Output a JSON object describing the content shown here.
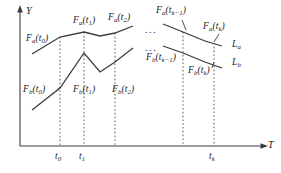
{
  "figure": {
    "kind": "line-diagram",
    "background_color": "#ffffff",
    "line_color": "#3c3c3c",
    "dashed_color": "#6b6b6b",
    "text_color": "#1c1c1c"
  },
  "axes": {
    "y_label": "Y",
    "x_label": "T",
    "origin": {
      "x": 20,
      "y": 146
    },
    "y_top": {
      "x": 20,
      "y": 8
    },
    "x_right": {
      "x": 268,
      "y": 146
    }
  },
  "ticks": [
    {
      "id": "t0",
      "base": "t",
      "sub": "0",
      "x": 60
    },
    {
      "id": "t1",
      "base": "t",
      "sub": "1",
      "x": 84
    },
    {
      "id": "tk",
      "base": "t",
      "sub": "k",
      "x": 214
    }
  ],
  "drop_lines_x": [
    60,
    84,
    115,
    183,
    214
  ],
  "curves": [
    {
      "name": "La",
      "label_base": "L",
      "label_sub": "a",
      "label_x": 232,
      "label_y": 45,
      "segments": [
        {
          "points": "32,54 60,37 84,32 100,36 115,33 133,26"
        },
        {
          "points": "163,24 183,32 205,41 222,46"
        }
      ]
    },
    {
      "name": "Lb",
      "label_base": "L",
      "label_sub": "b",
      "label_x": 232,
      "label_y": 63,
      "segments": [
        {
          "points": "32,110 60,88 84,53 100,72 115,62 133,48"
        },
        {
          "points": "163,46 183,53 205,62 222,68"
        }
      ]
    }
  ],
  "ellipses": [
    {
      "id": "upper-ellipsis",
      "text": "...",
      "x": 145,
      "y": 27
    },
    {
      "id": "lower-ellipsis",
      "text": "...",
      "x": 145,
      "y": 45
    }
  ],
  "point_labels": [
    {
      "id": "Fa_t0",
      "base": "F",
      "base_sub": "a",
      "arg_base": "t",
      "arg_sub": "0",
      "x": 28,
      "y": 39,
      "leader": null
    },
    {
      "id": "Fa_t1",
      "base": "F",
      "base_sub": "a",
      "arg_base": "t",
      "arg_sub": "1",
      "x": 74,
      "y": 20,
      "leader": null
    },
    {
      "id": "Fa_t2",
      "base": "F",
      "base_sub": "a",
      "arg_base": "t",
      "arg_sub": "2",
      "x": 110,
      "y": 17,
      "leader": null
    },
    {
      "id": "Fa_tk1",
      "base": "F",
      "base_sub": "a",
      "arg_base": "t",
      "arg_sub": "k−1",
      "x": 155,
      "y": 10,
      "leader": "163,19 170,32"
    },
    {
      "id": "Fa_tk",
      "base": "F",
      "base_sub": "a",
      "arg_base": "t",
      "arg_sub": "k",
      "x": 205,
      "y": 26,
      "leader": "212,35 206,42"
    },
    {
      "id": "Fb_t0",
      "base": "F",
      "base_sub": "b",
      "arg_base": "t",
      "arg_sub": "0",
      "x": 25,
      "y": 89,
      "leader": "52,92 58,86"
    },
    {
      "id": "Fb_t1",
      "base": "F",
      "base_sub": "b",
      "arg_base": "t",
      "arg_sub": "1",
      "x": 75,
      "y": 89,
      "leader": null
    },
    {
      "id": "Fb_t2",
      "base": "F",
      "base_sub": "b",
      "arg_base": "t",
      "arg_sub": "2",
      "x": 113,
      "y": 89,
      "leader": null
    },
    {
      "id": "Fb_tk1",
      "base": "F",
      "base_sub": "b",
      "arg_base": "t",
      "arg_sub": "k−1",
      "x": 148,
      "y": 57,
      "leader": null
    },
    {
      "id": "Fb_tk",
      "base": "F",
      "base_sub": "b",
      "arg_base": "t",
      "arg_sub": "k",
      "x": 190,
      "y": 70,
      "leader": null
    }
  ]
}
